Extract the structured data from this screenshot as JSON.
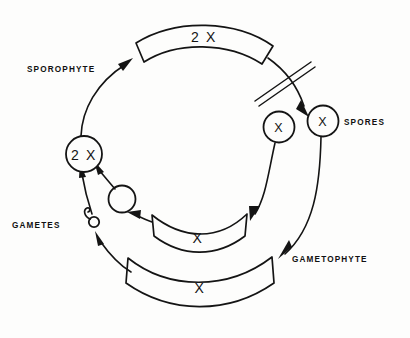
{
  "figure": {
    "background_color": "#fdfdfc",
    "ink_color": "#141414"
  },
  "labels": {
    "sporophyte": "SPOROPHYTE",
    "spores": "SPORES",
    "gametophyte": "GAMETOPHYTE",
    "gametes": "GAMETES"
  },
  "structures": {
    "sporophyte_band": {
      "ploidy": "2 X"
    },
    "zygote_circle": {
      "ploidy": "2 X"
    },
    "spore_left_circle": {
      "ploidy": "X"
    },
    "spore_right_circle": {
      "ploidy": "X"
    },
    "gametophyte_inner_band": {
      "ploidy": "X"
    },
    "gametophyte_outer_band": {
      "ploidy": "X"
    },
    "egg_cell": {
      "ploidy": ""
    },
    "sperm_cell": {
      "ploidy": ""
    }
  },
  "markers": {
    "meiosis_slash": "double-slash-reduction-division"
  },
  "icons": {
    "meiosis": "double-slash-icon",
    "egg": "egg-cell-icon",
    "sperm": "sperm-cell-icon"
  }
}
